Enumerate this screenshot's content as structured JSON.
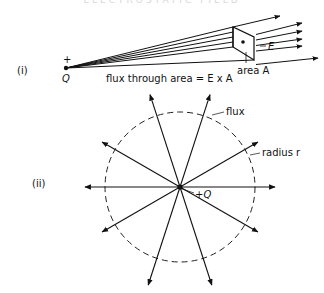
{
  "figure": {
    "header_fragment": "ELECTROSTATIC FIELD",
    "part_i": {
      "label": "(i)",
      "charge_sign": "+",
      "charge_label": "Q",
      "area_label": "area A",
      "field_label": "E",
      "caption": "flux through area = E x A"
    },
    "part_ii": {
      "label": "(ii)",
      "flux_label": "flux",
      "radius_label": "radius r",
      "charge_label": "+Q",
      "num_field_lines": 12
    }
  }
}
